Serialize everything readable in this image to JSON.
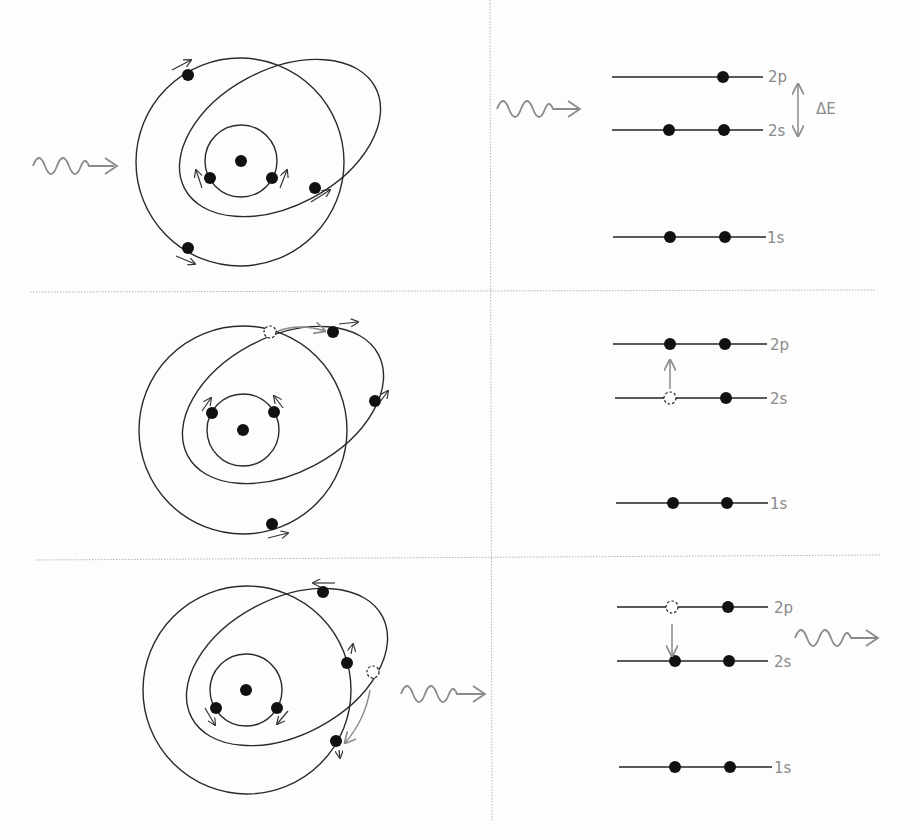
{
  "diagram": {
    "levels": [
      "2p",
      "2s",
      "1s"
    ],
    "delta_label": "ΔE",
    "panels": [
      {
        "id": "incoming-photon",
        "photon": "incoming",
        "levels": {
          "2p": {
            "label": "2p",
            "electrons": 1,
            "holes": 0
          },
          "2s": {
            "label": "2s",
            "electrons": 2,
            "holes": 0
          },
          "1s": {
            "label": "1s",
            "electrons": 2,
            "holes": 0
          }
        },
        "annotation": "ΔE"
      },
      {
        "id": "absorption",
        "photon": "none",
        "transition": "2s → 2p",
        "levels": {
          "2p": {
            "label": "2p",
            "electrons": 2,
            "holes": 0
          },
          "2s": {
            "label": "2s",
            "electrons": 1,
            "holes": 1
          },
          "1s": {
            "label": "1s",
            "electrons": 2,
            "holes": 0
          }
        }
      },
      {
        "id": "emission",
        "photon": "outgoing",
        "transition": "2p → 2s",
        "levels": {
          "2p": {
            "label": "2p",
            "electrons": 1,
            "holes": 1
          },
          "2s": {
            "label": "2s",
            "electrons": 2,
            "holes": 0
          },
          "1s": {
            "label": "1s",
            "electrons": 2,
            "holes": 0
          }
        }
      }
    ],
    "colors": {
      "ink": "#111111",
      "photon": "#8a8a8a",
      "divider": "#b5b5b5"
    }
  }
}
